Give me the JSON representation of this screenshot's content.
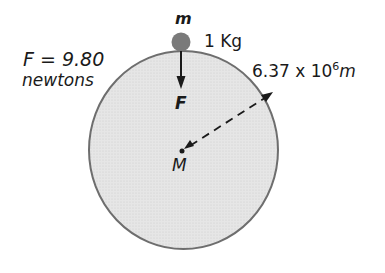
{
  "diagram": {
    "type": "gravitational-force-illustration",
    "colors": {
      "earth_fill": "#e2e2e2",
      "earth_stroke": "#6e6e6e",
      "mass_ball": "#7a7a7a",
      "ink": "#1a1a1a"
    },
    "labels": {
      "force_equation": "F = 9.80",
      "force_unit": "newtons",
      "small_mass_symbol": "m",
      "small_mass_value": "1 Kg",
      "radius_base": "6.37 x 10",
      "radius_exponent": "6",
      "radius_unit": "m",
      "force_arrow_label": "F",
      "earth_mass_symbol": "M"
    },
    "nodes": [
      {
        "id": "earth",
        "shape": "circle",
        "label": "M"
      },
      {
        "id": "small-mass",
        "shape": "ball",
        "label": "m",
        "value": "1 Kg"
      }
    ],
    "edges": [
      {
        "from": "small-mass",
        "to": "earth",
        "style": "solid-arrow",
        "label": "F"
      },
      {
        "from": "earth-surface",
        "to": "earth-center",
        "style": "dashed-arrow",
        "label": "6.37 x 10^6 m"
      }
    ]
  }
}
